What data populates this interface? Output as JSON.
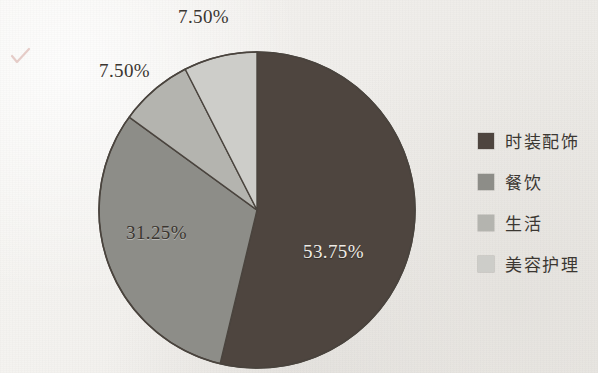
{
  "chart_data": {
    "type": "pie",
    "title": "",
    "subtitle": "",
    "xlabel": "",
    "ylabel": "",
    "grid": false,
    "legend_position": "right",
    "start_angle_deg": 0,
    "direction": "clockwise",
    "categories": [
      "时装配饰",
      "餐饮",
      "生活",
      "美容护理"
    ],
    "values": [
      53.75,
      31.25,
      7.5,
      7.5
    ],
    "value_unit": "%",
    "colors": [
      "#4e453f",
      "#8d8d88",
      "#b4b4af",
      "#cdcdc9"
    ],
    "slices": [
      {
        "label": "时装配饰",
        "value": 53.75,
        "data_label": "53.75%",
        "color": "#4e453f",
        "label_color_mode": "light-on-dark"
      },
      {
        "label": "餐饮",
        "value": 31.25,
        "data_label": "31.25%",
        "color": "#8d8d88",
        "label_color_mode": "dark-on-light"
      },
      {
        "label": "生活",
        "value": 7.5,
        "data_label": "7.50%",
        "color": "#b4b4af",
        "label_color_mode": "dark-on-light"
      },
      {
        "label": "美容护理",
        "value": 7.5,
        "data_label": "7.50%",
        "color": "#cdcdc9",
        "label_color_mode": "dark-on-light"
      }
    ]
  },
  "pie": {
    "center_x": 257,
    "center_y": 210,
    "radius": 158,
    "outline_color": "#4a443e",
    "data_labels": [
      {
        "text": "53.75%",
        "x": 303,
        "y": 241,
        "mode": "light-on-dark",
        "name": "pie-label-fashion"
      },
      {
        "text": "31.25%",
        "x": 126,
        "y": 222,
        "mode": "dark-on-light",
        "name": "pie-label-dining"
      },
      {
        "text": "7.50%",
        "x": 99,
        "y": 60,
        "mode": "dark-on-light",
        "name": "pie-label-life"
      },
      {
        "text": "7.50%",
        "x": 178,
        "y": 6,
        "mode": "dark-on-light",
        "name": "pie-label-beauty"
      }
    ]
  },
  "legend": {
    "items": [
      {
        "label": "时装配饰",
        "color": "#4e453f"
      },
      {
        "label": "餐饮",
        "color": "#8d8d88"
      },
      {
        "label": "生活",
        "color": "#b4b4af"
      },
      {
        "label": "美容护理",
        "color": "#cdcdc9"
      }
    ]
  },
  "annotations": {
    "pen_mark_color": "#c98e84"
  }
}
